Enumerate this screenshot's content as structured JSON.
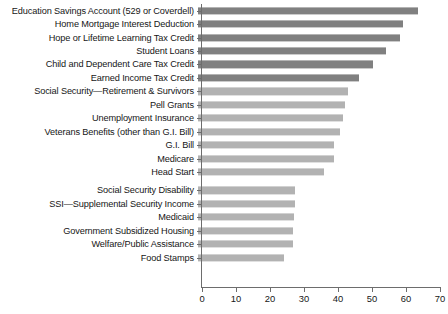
{
  "chart_data": {
    "type": "bar",
    "orientation": "horizontal",
    "title": "",
    "xlabel": "",
    "ylabel": "",
    "xlim": [
      0,
      70
    ],
    "xticks": [
      0,
      10,
      20,
      30,
      40,
      50,
      60,
      70
    ],
    "grid": false,
    "legend": "none",
    "categories": [
      "Education Savings Account (529 or Coverdell)",
      "Home Mortgage Interest Deduction",
      "Hope or Lifetime Learning Tax Credit",
      "Student Loans",
      "Child and Dependent Care Tax Credit",
      "Earned Income Tax Credit",
      "Social Security—Retirement & Survivors",
      "Pell Grants",
      "Unemployment Insurance",
      "Veterans Benefits (other than G.I. Bill)",
      "G.I. Bill",
      "Medicare",
      "Head Start",
      "Social Security Disability",
      "SSI—Supplemental Security Income",
      "Medicaid",
      "Government Subsidized Housing",
      "Welfare/Public Assistance",
      "Food Stamps"
    ],
    "values": [
      64.7,
      60.3,
      59.4,
      55.3,
      51.5,
      47.4,
      44.1,
      43.2,
      42.6,
      41.8,
      40.0,
      39.9,
      37.0,
      28.5,
      28.5,
      28.1,
      28.0,
      28.0,
      25.2
    ],
    "bar_shades": [
      "dark",
      "dark",
      "dark",
      "dark",
      "dark",
      "dark",
      "light",
      "light",
      "light",
      "light",
      "light",
      "light",
      "light",
      "light",
      "light",
      "light",
      "light",
      "light",
      "light"
    ],
    "group_break_after_index": 12,
    "colors": {
      "dark_bar": "#808080",
      "light_bar": "#b2b2b2",
      "axis": "#6d6d6d",
      "text": "#161616",
      "background": "#ffffff"
    }
  },
  "footnote": {
    "text": ""
  }
}
